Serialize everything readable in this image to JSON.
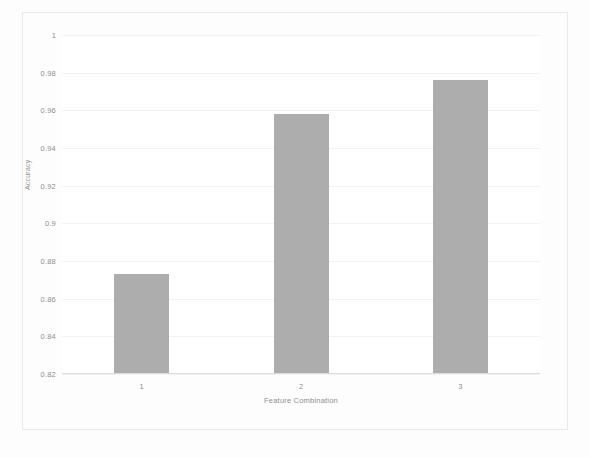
{
  "chart_data": {
    "type": "bar",
    "title": "SVM(Support Vector Machine)",
    "xlabel": "Feature Combination",
    "ylabel": "Accuracy",
    "categories": [
      "1",
      "2",
      "3"
    ],
    "values": [
      0.873,
      0.958,
      0.976
    ],
    "ylim": [
      0.82,
      1
    ],
    "yticks": [
      1,
      0.98,
      0.96,
      0.94,
      0.92,
      0.9,
      0.88,
      0.86,
      0.84,
      0.82
    ],
    "ytick_labels": [
      "1",
      "0.98",
      "0.96",
      "0.94",
      "0.92",
      "0.9",
      "0.88",
      "0.86",
      "0.84",
      "0.82"
    ],
    "xtick_labels": [
      "1",
      "2",
      "3"
    ],
    "grid": true,
    "legend": null,
    "bar_color": "#adadad",
    "background_color": "#ffffff",
    "text_color": "#8e8e8e"
  }
}
